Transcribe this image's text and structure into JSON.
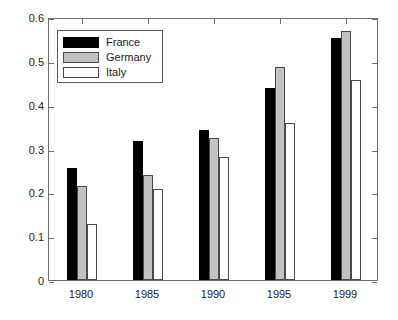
{
  "chart_data": {
    "type": "bar",
    "title": "",
    "subtitle": "",
    "xlabel": "",
    "ylabel": "",
    "categories": [
      "1980",
      "1985",
      "1990",
      "1995",
      "1999"
    ],
    "series": [
      {
        "name": "France",
        "color": "#000000",
        "values": [
          0.255,
          0.317,
          0.342,
          0.437,
          0.553
        ]
      },
      {
        "name": "Germany",
        "color": "#c2c2c2",
        "values": [
          0.214,
          0.24,
          0.324,
          0.486,
          0.568
        ]
      },
      {
        "name": "Italy",
        "color": "#ffffff",
        "values": [
          0.127,
          0.208,
          0.28,
          0.359,
          0.456
        ]
      }
    ],
    "ylim": [
      0,
      0.6
    ],
    "yticks": [
      0,
      0.1,
      0.2,
      0.3,
      0.4,
      0.5,
      0.6
    ],
    "ytick_labels": [
      "0",
      "0.1",
      "0.2",
      "0.3",
      "0.4",
      "0.5",
      "0.6"
    ],
    "grid": false,
    "legend_position": "top-left",
    "legend_entries": [
      "France",
      "Germany",
      "Italy"
    ],
    "axis_color": "#6e6e6e",
    "background": "#ffffff"
  }
}
